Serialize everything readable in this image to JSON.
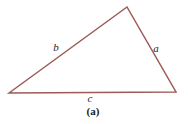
{
  "figure": {
    "caption": "(a)",
    "background_color": "#ffffff",
    "stroke_color": "#9b5a56",
    "label_color": "#262626",
    "stroke_width": 1.5,
    "width": 188,
    "height": 124
  },
  "triangle": {
    "vertices": [
      {
        "name": "left-vertex",
        "x": 9,
        "y": 93
      },
      {
        "name": "apex-vertex",
        "x": 127,
        "y": 7
      },
      {
        "name": "right-vertex",
        "x": 176,
        "y": 92
      }
    ],
    "points_attr": "9,93 127,7 176,92",
    "sides": [
      {
        "id": "a",
        "label": "a",
        "from": "apex-vertex",
        "to": "right-vertex",
        "label_x": 156,
        "label_y": 48
      },
      {
        "id": "b",
        "label": "b",
        "from": "left-vertex",
        "to": "apex-vertex",
        "label_x": 56,
        "label_y": 47
      },
      {
        "id": "c",
        "label": "c",
        "from": "left-vertex",
        "to": "right-vertex",
        "label_x": 90,
        "label_y": 98
      }
    ]
  }
}
